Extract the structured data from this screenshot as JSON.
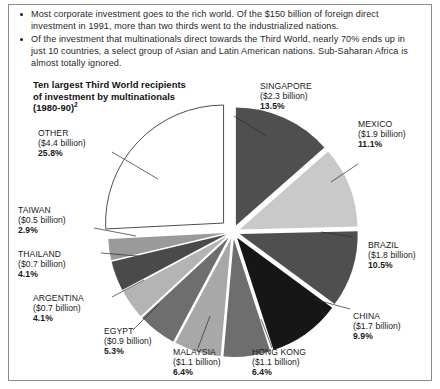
{
  "bullets": [
    "Most corporate investment goes to the rich world.  Of the $150 billion of foreign direct investment in 1991, more than two thirds went to the industrialized nations.",
    "Of the investment that multinationals direct towards the Third World, nearly 70% ends up in just 10 countries, a select group of Asian and Latin American nations. Sub-Saharan Africa is almost totally ignored."
  ],
  "chart_title": {
    "line1": "Ten largest Third World recipients",
    "line2": "of investment by multinationals",
    "line3": "(1980-90)",
    "footnote_marker": "2"
  },
  "chart_data": {
    "type": "pie",
    "title": "Ten largest Third World recipients of investment by multinationals (1980-90)",
    "unit": "billion US$",
    "legend": "labels-attached-to-slices",
    "categories": [
      "SINGAPORE",
      "MEXICO",
      "BRAZIL",
      "CHINA",
      "HONG KONG",
      "MALAYSIA",
      "EGYPT",
      "ARGENTINA",
      "THAILAND",
      "TAIWAN",
      "OTHER"
    ],
    "values": [
      13.5,
      11.1,
      10.5,
      9.9,
      6.4,
      6.4,
      5.3,
      4.1,
      4.1,
      2.9,
      25.8
    ],
    "amounts": [
      2.3,
      1.9,
      1.8,
      1.7,
      1.1,
      1.1,
      0.9,
      0.7,
      0.7,
      0.5,
      4.4
    ],
    "slices": [
      {
        "name": "SINGAPORE",
        "amount_text": "($2.3 billion)",
        "pct_text": "13.5%",
        "value": 13.5,
        "color": "#4f4f4f"
      },
      {
        "name": "MEXICO",
        "amount_text": "($1.9 billion)",
        "pct_text": "11.1%",
        "value": 11.1,
        "color": "#c9c9c9"
      },
      {
        "name": "BRAZIL",
        "amount_text": "($1.8 billion)",
        "pct_text": "10.5%",
        "value": 10.5,
        "color": "#4f4f4f"
      },
      {
        "name": "CHINA",
        "amount_text": "($1.7 billion)",
        "pct_text": "9.9%",
        "value": 9.9,
        "color": "#161616"
      },
      {
        "name": "HONG KONG",
        "amount_text": "($1.1 billion)",
        "pct_text": "6.4%",
        "value": 6.4,
        "color": "#6e6e6e"
      },
      {
        "name": "MALAYSIA",
        "amount_text": "($1.1 billion)",
        "pct_text": "6.4%",
        "value": 6.4,
        "color": "#a8a8a8"
      },
      {
        "name": "EGYPT",
        "amount_text": "($0.9 billion)",
        "pct_text": "5.3%",
        "value": 5.3,
        "color": "#6e6e6e"
      },
      {
        "name": "ARGENTINA",
        "amount_text": "($0.7 billion)",
        "pct_text": "4.1%",
        "value": 4.1,
        "color": "#b4b4b4"
      },
      {
        "name": "THAILAND",
        "amount_text": "($0.7 billion)",
        "pct_text": "4.1%",
        "value": 4.1,
        "color": "#4a4a4a"
      },
      {
        "name": "TAIWAN",
        "amount_text": "($0.5 billion)",
        "pct_text": "2.9%",
        "value": 2.9,
        "color": "#9a9a9a"
      },
      {
        "name": "OTHER",
        "amount_text": "($4.4 billion)",
        "pct_text": "25.8%",
        "value": 25.8,
        "color": "#ffffff"
      }
    ]
  }
}
